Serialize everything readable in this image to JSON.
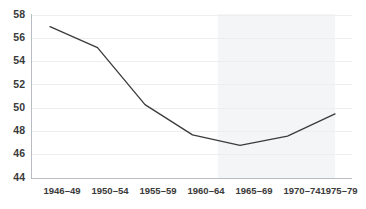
{
  "chart_data": {
    "type": "line",
    "title": "",
    "subtitle": "",
    "xlabel": "",
    "ylabel": "",
    "categories": [
      "1946–49",
      "1950–54",
      "1955–59",
      "1960–64",
      "1965–69",
      "1970–74",
      "1975–79"
    ],
    "values": [
      57.0,
      55.2,
      50.3,
      47.7,
      46.8,
      47.6,
      49.5
    ],
    "series": [
      {
        "name": "",
        "values": [
          57.0,
          55.2,
          50.3,
          47.7,
          46.8,
          47.6,
          49.5
        ]
      }
    ],
    "ylim": [
      44,
      58
    ],
    "yticks": [
      44,
      46,
      48,
      50,
      52,
      54,
      56,
      58
    ],
    "ytick_labels": [
      "44",
      "46",
      "48",
      "50",
      "52",
      "54",
      "56",
      "58"
    ],
    "xtick_labels": [
      "1946–49",
      "1950–54",
      "1955–59",
      "1960–64",
      "1965–69",
      "1970–74",
      "1975–79"
    ],
    "grid": true,
    "grid_axis": "y",
    "legend": false,
    "legend_position": "none",
    "annotations": [],
    "shaded_region": {
      "start_category": "1965–69",
      "end_category": "1975–79",
      "color": "#f4f5f6"
    },
    "colors": {
      "line": "#3b3b3b",
      "grid": "#eceef0",
      "axis": "#b9bcc0",
      "tick_text": "#3a3a3a",
      "background": "#ffffff",
      "shade": "#f4f5f6"
    }
  }
}
